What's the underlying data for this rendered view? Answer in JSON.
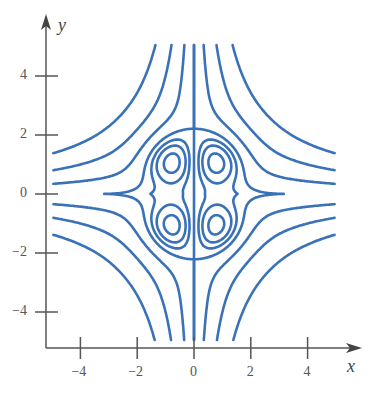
{
  "chart_data": {
    "type": "contour",
    "title": "",
    "xlabel": "x",
    "ylabel": "y",
    "xlim": [
      -5,
      5
    ],
    "ylim": [
      -5,
      5
    ],
    "xticks": [
      -4,
      -2,
      0,
      2,
      4
    ],
    "yticks": [
      -4,
      -2,
      0,
      2,
      4
    ],
    "xtick_labels": [
      "−4",
      "−2",
      "0",
      "2",
      "4"
    ],
    "ytick_labels": [
      "−4",
      "−2",
      "0",
      "2",
      "4"
    ],
    "grid": false,
    "legend": null,
    "line_color": "#3a72b8",
    "features": {
      "lobe_centers": [
        [
          -1.2,
          0.8
        ],
        [
          1.2,
          0.8
        ],
        [
          -1.2,
          -0.8
        ],
        [
          1.2,
          -0.8
        ]
      ],
      "vertical_contour_at_x": 0,
      "outer_curves": "hyperbola-like level curves in each quadrant, concave toward the corners"
    }
  },
  "axes": {
    "x_label": "x",
    "y_label": "y"
  }
}
